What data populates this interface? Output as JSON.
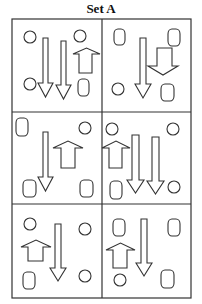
{
  "title": "Set A",
  "grid": {
    "left": 12,
    "top": 19,
    "right": 191,
    "bottom": 298,
    "col_divider": 102,
    "row_dividers": [
      112,
      204
    ]
  },
  "cells": [
    {
      "id": "r1c1",
      "shapes": [
        {
          "type": "circle",
          "cx": 30,
          "cy": 37,
          "r": 6
        },
        {
          "type": "circle",
          "cx": 30,
          "cy": 84,
          "r": 6
        },
        {
          "type": "circle",
          "cx": 80,
          "cy": 36,
          "r": 6
        },
        {
          "type": "arrow-down",
          "x1": 43,
          "x2": 48,
          "top": 38,
          "head_y": 83,
          "hx1": 38,
          "hx2": 53,
          "tip": 97
        },
        {
          "type": "arrow-down",
          "x1": 61,
          "x2": 66,
          "top": 41,
          "head_y": 85,
          "hx1": 56,
          "hx2": 71,
          "tip": 99
        },
        {
          "type": "arrow-up",
          "x1": 79,
          "x2": 92,
          "bottom": 73,
          "head_y": 54,
          "hx1": 73,
          "hx2": 100,
          "tip": 48
        },
        {
          "type": "rounded-rect",
          "x": 78,
          "y": 79,
          "w": 11,
          "h": 17
        }
      ]
    },
    {
      "id": "r1c2",
      "shapes": [
        {
          "type": "rounded-rect",
          "x": 114,
          "y": 29,
          "w": 11,
          "h": 16
        },
        {
          "type": "rounded-rect",
          "x": 168,
          "y": 29,
          "w": 12,
          "h": 17
        },
        {
          "type": "arrow-down",
          "x1": 140,
          "x2": 146,
          "top": 38,
          "head_y": 84,
          "hx1": 135,
          "hx2": 151,
          "tip": 98
        },
        {
          "type": "arrow-down",
          "x1": 157,
          "x2": 172,
          "top": 48,
          "head_y": 66,
          "hx1": 148,
          "hx2": 178,
          "tip": 75
        },
        {
          "type": "circle",
          "cx": 118,
          "cy": 89,
          "r": 6
        },
        {
          "type": "rounded-rect",
          "x": 161,
          "y": 84,
          "w": 13,
          "h": 17
        }
      ]
    },
    {
      "id": "r2c1",
      "shapes": [
        {
          "type": "rounded-rect",
          "x": 16,
          "y": 118,
          "w": 12,
          "h": 18
        },
        {
          "type": "circle",
          "cx": 85,
          "cy": 128,
          "r": 6
        },
        {
          "type": "arrow-down",
          "x1": 43,
          "x2": 48,
          "top": 132,
          "head_y": 177,
          "hx1": 38,
          "hx2": 53,
          "tip": 191
        },
        {
          "type": "arrow-up",
          "x1": 61,
          "x2": 75,
          "bottom": 168,
          "head_y": 148,
          "hx1": 53,
          "hx2": 83,
          "tip": 141
        },
        {
          "type": "rounded-rect",
          "x": 23,
          "y": 180,
          "w": 13,
          "h": 17
        },
        {
          "type": "rounded-rect",
          "x": 80,
          "y": 180,
          "w": 13,
          "h": 17
        }
      ]
    },
    {
      "id": "r2c2",
      "shapes": [
        {
          "type": "circle",
          "cx": 112,
          "cy": 129,
          "r": 6
        },
        {
          "type": "circle",
          "cx": 173,
          "cy": 129,
          "r": 6
        },
        {
          "type": "arrow-up",
          "x1": 109,
          "x2": 122,
          "bottom": 168,
          "head_y": 148,
          "hx1": 102,
          "hx2": 130,
          "tip": 141
        },
        {
          "type": "arrow-down",
          "x1": 132,
          "x2": 139,
          "top": 135,
          "head_y": 180,
          "hx1": 127,
          "hx2": 144,
          "tip": 193
        },
        {
          "type": "arrow-down",
          "x1": 152,
          "x2": 159,
          "top": 137,
          "head_y": 181,
          "hx1": 147,
          "hx2": 164,
          "tip": 194
        },
        {
          "type": "rounded-rect",
          "x": 110,
          "y": 181,
          "w": 12,
          "h": 18
        },
        {
          "type": "circle",
          "cx": 174,
          "cy": 187,
          "r": 6
        }
      ]
    },
    {
      "id": "r3c1",
      "shapes": [
        {
          "type": "circle",
          "cx": 30,
          "cy": 224,
          "r": 6
        },
        {
          "type": "circle",
          "cx": 85,
          "cy": 229,
          "r": 6
        },
        {
          "type": "arrow-up",
          "x1": 28,
          "x2": 43,
          "bottom": 261,
          "head_y": 247,
          "hx1": 21,
          "hx2": 51,
          "tip": 240
        },
        {
          "type": "arrow-down",
          "x1": 55,
          "x2": 61,
          "top": 224,
          "head_y": 268,
          "hx1": 50,
          "hx2": 66,
          "tip": 281
        },
        {
          "type": "rounded-rect",
          "x": 23,
          "y": 272,
          "w": 12,
          "h": 17
        },
        {
          "type": "circle",
          "cx": 85,
          "cy": 276,
          "r": 6
        }
      ]
    },
    {
      "id": "r3c2",
      "shapes": [
        {
          "type": "rounded-rect",
          "x": 113,
          "y": 219,
          "w": 12,
          "h": 17
        },
        {
          "type": "rounded-rect",
          "x": 168,
          "y": 219,
          "w": 12,
          "h": 17
        },
        {
          "type": "arrow-up",
          "x1": 113,
          "x2": 127,
          "bottom": 268,
          "head_y": 250,
          "hx1": 106,
          "hx2": 135,
          "tip": 243
        },
        {
          "type": "arrow-down",
          "x1": 141,
          "x2": 147,
          "top": 219,
          "head_y": 263,
          "hx1": 136,
          "hx2": 152,
          "tip": 276
        },
        {
          "type": "circle",
          "cx": 120,
          "cy": 280,
          "r": 6
        },
        {
          "type": "rounded-rect",
          "x": 161,
          "y": 270,
          "w": 13,
          "h": 18
        }
      ]
    }
  ]
}
